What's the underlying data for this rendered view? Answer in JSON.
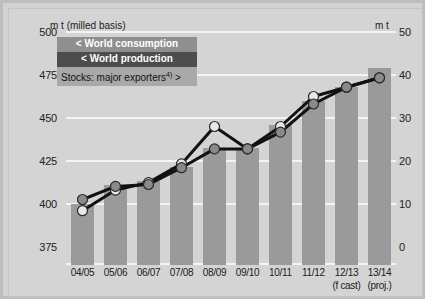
{
  "axes": {
    "left_unit": "m t (milled basis)",
    "right_unit": "m t",
    "left_ticks": [
      "500",
      "475",
      "450",
      "425",
      "400",
      "375"
    ],
    "right_ticks": [
      "50",
      "40",
      "30",
      "20",
      "10",
      "0"
    ]
  },
  "legend": {
    "consumption": "< World consumption",
    "production": "< World production",
    "stocks": "Stocks: major exporters",
    "stocks_note": "4)",
    "stocks_arrow": ">"
  },
  "colors": {
    "bar": "#9a9a9a",
    "consumption_marker": "#e8e8e8",
    "production_marker": "#8a8a8a",
    "line": "#111111",
    "background": "#d4d4d4",
    "gridline": "#f4f4f4"
  },
  "chart_data": {
    "type": "line",
    "title": "",
    "xlabel": "",
    "ylabel": "m t (milled basis)",
    "categories": [
      "04/05",
      "05/06",
      "06/07",
      "07/08",
      "08/09",
      "09/10",
      "10/11",
      "11/12",
      "12/13",
      "13/14"
    ],
    "category_notes": [
      "",
      "",
      "",
      "",
      "",
      "",
      "",
      "",
      "(f cast)",
      "(proj.)"
    ],
    "ylim": [
      375,
      500
    ],
    "y2lim": [
      0,
      50
    ],
    "grid": true,
    "legend_position": "top-left",
    "series": [
      {
        "name": "World consumption",
        "axis": "left",
        "values": [
          404,
          415,
          419,
          429,
          449,
          437,
          449,
          465,
          470,
          475
        ]
      },
      {
        "name": "World production",
        "axis": "left",
        "values": [
          410,
          417,
          418,
          427,
          437,
          437,
          446,
          461,
          470,
          475
        ]
      },
      {
        "name": "Stocks: major exporters",
        "axis": "right",
        "type": "bar",
        "values": [
          13,
          17,
          18,
          21,
          25,
          25,
          30,
          35,
          38,
          42
        ]
      }
    ]
  }
}
